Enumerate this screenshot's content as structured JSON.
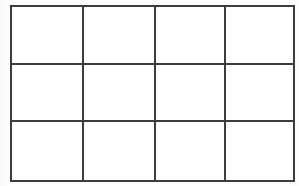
{
  "figure": {
    "kind": "empty-grid-table",
    "title": "",
    "rows": 3,
    "columns": 4,
    "cell_count": 12,
    "line_color": "#3d3d3d",
    "cell_fill": "#ffffff",
    "page_background": "#fefefe",
    "line_thickness_px": 2,
    "bounds": {
      "left_px": 10,
      "top_px": 5,
      "width_px": 281,
      "height_px": 173
    },
    "column_widths_px": [
      72,
      72,
      70,
      67
    ],
    "row_heights_px": [
      58,
      57,
      58
    ],
    "vertical_divider_x_px": [
      82,
      154,
      224
    ],
    "horizontal_divider_y_px": [
      63,
      120
    ],
    "cells": [
      {
        "row": 1,
        "col": 1,
        "text": ""
      },
      {
        "row": 1,
        "col": 2,
        "text": ""
      },
      {
        "row": 1,
        "col": 3,
        "text": ""
      },
      {
        "row": 1,
        "col": 4,
        "text": ""
      },
      {
        "row": 2,
        "col": 1,
        "text": ""
      },
      {
        "row": 2,
        "col": 2,
        "text": ""
      },
      {
        "row": 2,
        "col": 3,
        "text": ""
      },
      {
        "row": 2,
        "col": 4,
        "text": ""
      },
      {
        "row": 3,
        "col": 1,
        "text": ""
      },
      {
        "row": 3,
        "col": 2,
        "text": ""
      },
      {
        "row": 3,
        "col": 3,
        "text": ""
      },
      {
        "row": 3,
        "col": 4,
        "text": ""
      }
    ]
  }
}
